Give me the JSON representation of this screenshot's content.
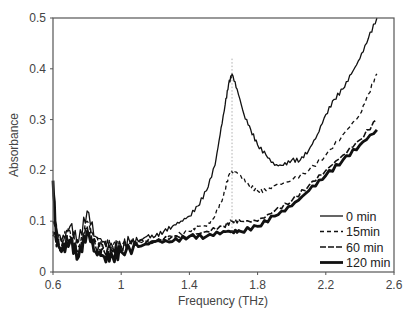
{
  "chart_data": {
    "type": "line",
    "title": "",
    "xlabel": "Frequency (THz)",
    "ylabel": "Absorbance",
    "xlim": [
      0.6,
      2.6
    ],
    "ylim": [
      0,
      0.5
    ],
    "xticks": [
      0.6,
      1,
      1.4,
      1.8,
      2.2,
      2.6
    ],
    "xtick_labels": [
      "0.6",
      "1",
      "1.4",
      "1.8",
      "2.2",
      "2.6"
    ],
    "yticks": [
      0,
      0.1,
      0.2,
      0.3,
      0.4,
      0.5
    ],
    "ytick_labels": [
      "0",
      "0.1",
      "0.2",
      "0.3",
      "0.4",
      "0.5"
    ],
    "grid": false,
    "legend_position": "lower right (inside)",
    "annotations": [
      {
        "type": "vertical-dotted-line",
        "x": 1.65,
        "y_from": 0.08,
        "y_to": 0.42
      }
    ],
    "series": [
      {
        "name": "0 min",
        "style": "solid-thin",
        "x": [
          0.6,
          0.65,
          0.7,
          0.75,
          0.8,
          0.85,
          0.9,
          0.95,
          1.0,
          1.05,
          1.1,
          1.15,
          1.2,
          1.25,
          1.3,
          1.35,
          1.4,
          1.45,
          1.5,
          1.55,
          1.58,
          1.61,
          1.63,
          1.65,
          1.68,
          1.72,
          1.76,
          1.8,
          1.85,
          1.9,
          1.95,
          2.0,
          2.05,
          2.1,
          2.15,
          2.2,
          2.25,
          2.3,
          2.35,
          2.4,
          2.45,
          2.5
        ],
        "y": [
          0.1,
          0.06,
          0.09,
          0.06,
          0.12,
          0.07,
          0.06,
          0.05,
          0.05,
          0.06,
          0.06,
          0.07,
          0.07,
          0.08,
          0.09,
          0.1,
          0.11,
          0.13,
          0.16,
          0.21,
          0.27,
          0.33,
          0.37,
          0.39,
          0.36,
          0.31,
          0.28,
          0.25,
          0.23,
          0.21,
          0.21,
          0.22,
          0.22,
          0.24,
          0.27,
          0.31,
          0.34,
          0.36,
          0.39,
          0.42,
          0.46,
          0.5
        ]
      },
      {
        "name": "15min",
        "style": "dashed-short",
        "x": [
          0.6,
          0.65,
          0.7,
          0.75,
          0.8,
          0.85,
          0.9,
          0.95,
          1.0,
          1.1,
          1.2,
          1.3,
          1.4,
          1.45,
          1.5,
          1.55,
          1.6,
          1.63,
          1.66,
          1.7,
          1.75,
          1.8,
          1.85,
          1.9,
          2.0,
          2.1,
          2.2,
          2.3,
          2.4,
          2.45,
          2.5
        ],
        "y": [
          0.08,
          0.06,
          0.08,
          0.05,
          0.1,
          0.06,
          0.05,
          0.05,
          0.05,
          0.06,
          0.06,
          0.07,
          0.08,
          0.09,
          0.09,
          0.11,
          0.15,
          0.19,
          0.2,
          0.19,
          0.17,
          0.16,
          0.16,
          0.17,
          0.18,
          0.2,
          0.23,
          0.27,
          0.31,
          0.35,
          0.39
        ]
      },
      {
        "name": "60 min",
        "style": "dashed-medium",
        "x": [
          0.6,
          0.65,
          0.7,
          0.75,
          0.8,
          0.85,
          0.9,
          0.95,
          1.0,
          1.1,
          1.2,
          1.3,
          1.4,
          1.5,
          1.6,
          1.65,
          1.7,
          1.8,
          1.9,
          2.0,
          2.1,
          2.2,
          2.3,
          2.4,
          2.5
        ],
        "y": [
          0.07,
          0.05,
          0.07,
          0.04,
          0.09,
          0.05,
          0.04,
          0.04,
          0.05,
          0.06,
          0.06,
          0.07,
          0.07,
          0.08,
          0.09,
          0.1,
          0.1,
          0.1,
          0.12,
          0.14,
          0.17,
          0.2,
          0.23,
          0.26,
          0.3
        ]
      },
      {
        "name": "120 min",
        "style": "solid-thick",
        "x": [
          0.6,
          0.62,
          0.65,
          0.7,
          0.75,
          0.8,
          0.85,
          0.9,
          0.95,
          1.0,
          1.1,
          1.2,
          1.3,
          1.4,
          1.5,
          1.6,
          1.65,
          1.7,
          1.8,
          1.9,
          2.0,
          2.1,
          2.2,
          2.3,
          2.4,
          2.5
        ],
        "y": [
          0.18,
          0.06,
          0.04,
          0.06,
          0.03,
          0.08,
          0.04,
          0.03,
          0.03,
          0.04,
          0.05,
          0.06,
          0.06,
          0.07,
          0.07,
          0.08,
          0.08,
          0.08,
          0.09,
          0.11,
          0.13,
          0.16,
          0.19,
          0.22,
          0.25,
          0.28
        ]
      }
    ]
  },
  "legend": {
    "items": [
      "0 min",
      "15min",
      "60 min",
      "120 min"
    ]
  },
  "axes": {
    "xlabel": "Frequency (THz)",
    "ylabel": "Absorbance"
  }
}
